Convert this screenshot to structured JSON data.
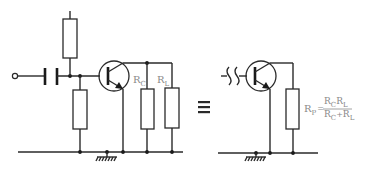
{
  "diagram": {
    "title": "",
    "left_circuit": {
      "labels": {
        "rc": {
          "main": "R",
          "sub": "C"
        },
        "rl": {
          "main": "R",
          "sub": "L"
        }
      }
    },
    "equivalence_symbol": "≡",
    "right_circuit": {
      "formula": {
        "lhs_main": "R",
        "lhs_sub": "P",
        "equals": "=",
        "num": {
          "a": "R",
          "a_sub": "C",
          "b": "R",
          "b_sub": "L"
        },
        "den": {
          "a": "R",
          "a_sub": "C",
          "plus": "+",
          "b": "R",
          "b_sub": "L"
        }
      }
    },
    "colors": {
      "line": "#2a2a2a",
      "label": "#8a8a8a",
      "background": "#ffffff"
    }
  }
}
